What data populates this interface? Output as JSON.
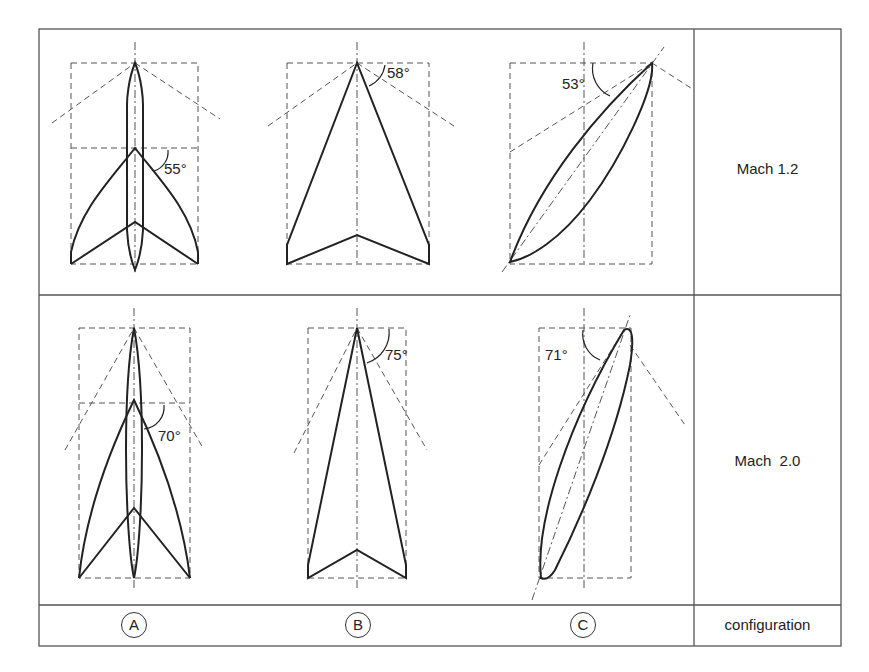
{
  "table": {
    "rows": [
      {
        "label": "Mach 1.2"
      },
      {
        "label": "Mach  2.0"
      }
    ],
    "footer_label": "configuration"
  },
  "configurations": [
    {
      "id": "A",
      "label": "A",
      "shape": "wing-body-swept-curved",
      "angles": {
        "mach_1_2": "55°",
        "mach_2_0": "70°"
      }
    },
    {
      "id": "B",
      "label": "B",
      "shape": "arrow-wing",
      "angles": {
        "mach_1_2": "58°",
        "mach_2_0": "75°"
      }
    },
    {
      "id": "C",
      "label": "C",
      "shape": "oblique-wing",
      "angles": {
        "mach_1_2": "53°",
        "mach_2_0": "71°"
      }
    }
  ],
  "colors": {
    "line": "#222222",
    "dashed": "#555555",
    "border": "#555555"
  }
}
